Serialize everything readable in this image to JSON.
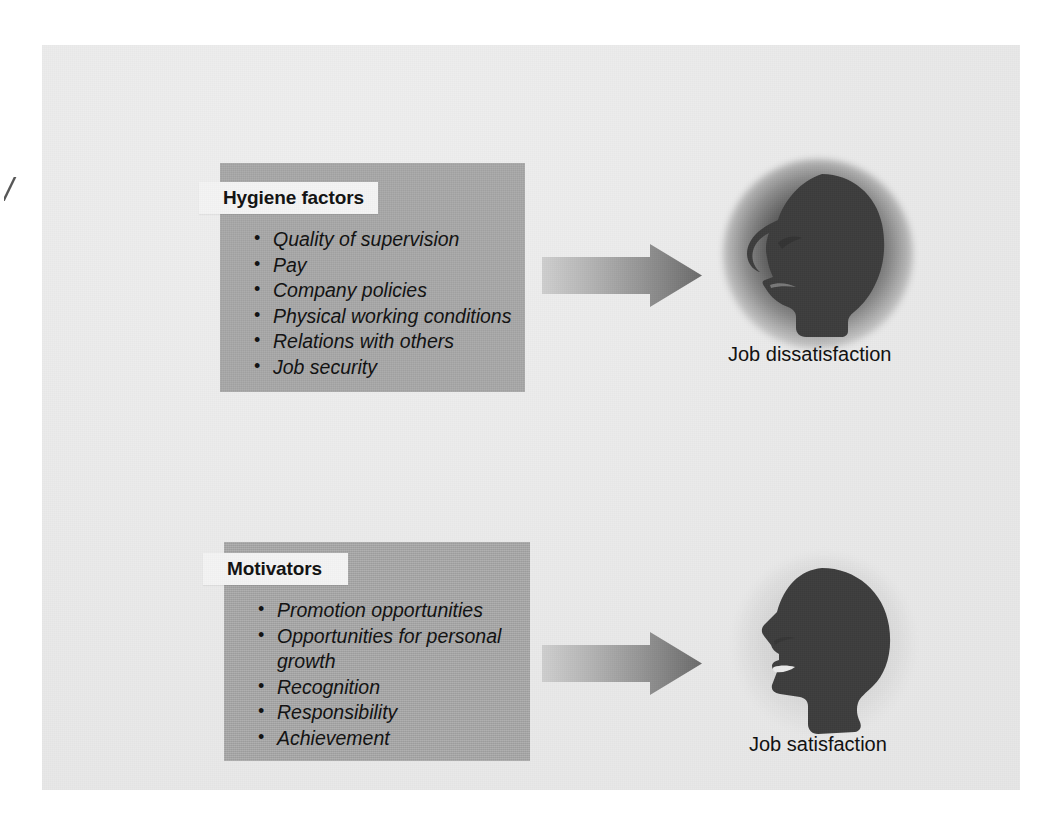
{
  "figure": {
    "margin_mark": "/",
    "canvas_color": "#e9e9e9",
    "box_color": "#a9a9a9",
    "title_band_color": "#f4f4f4",
    "text_color": "#111111",
    "arrow_gradient_from": "#c9c9c9",
    "arrow_gradient_to": "#6f6f6f",
    "head_color": "#4a4a4a"
  },
  "hygiene": {
    "title": "Hygiene factors",
    "items": [
      "Quality of supervision",
      "Pay",
      "Company policies",
      "Physical working conditions",
      "Relations with others",
      "Job security"
    ],
    "outcome_caption": "Job dissatisfaction",
    "arrow_label": "leads to"
  },
  "motivators": {
    "title": "Motivators",
    "items": [
      "Promotion opportunities",
      "Opportunities for personal\ngrowth",
      "Recognition",
      "Responsibility",
      "Achievement"
    ],
    "outcome_caption": "Job satisfaction",
    "arrow_label": "leads to"
  }
}
